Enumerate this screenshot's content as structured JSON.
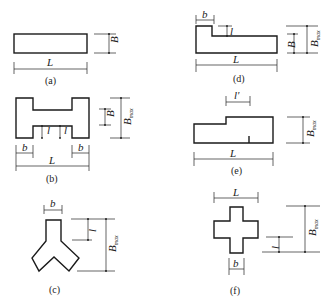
{
  "figure": {
    "panels": [
      {
        "id": "a",
        "caption": "(a)",
        "shape": "rectangle",
        "dimensions": {
          "length": "L",
          "width": "B"
        }
      },
      {
        "id": "b",
        "caption": "(b)",
        "shape": "H-shape",
        "dimensions": {
          "length": "L",
          "width": "B",
          "max_width": "B",
          "max_width_sub": "max",
          "wing_width": "b",
          "projection": "l"
        }
      },
      {
        "id": "c",
        "caption": "(c)",
        "shape": "Y-shape",
        "dimensions": {
          "arm_width": "b",
          "projection": "l",
          "max_width": "B",
          "max_width_sub": "max"
        }
      },
      {
        "id": "d",
        "caption": "(d)",
        "shape": "L-shape",
        "dimensions": {
          "length": "L",
          "width": "B",
          "max_width": "B",
          "max_width_sub": "max",
          "wing_width": "b",
          "projection": "l"
        }
      },
      {
        "id": "e",
        "caption": "(e)",
        "shape": "stepped",
        "dimensions": {
          "length": "L",
          "offset": "l'",
          "max_width": "B",
          "max_width_sub": "max"
        }
      },
      {
        "id": "f",
        "caption": "(f)",
        "shape": "cross",
        "dimensions": {
          "length": "L",
          "arm_width": "b",
          "projection": "l",
          "max_width": "B",
          "max_width_sub": "max"
        }
      }
    ]
  }
}
